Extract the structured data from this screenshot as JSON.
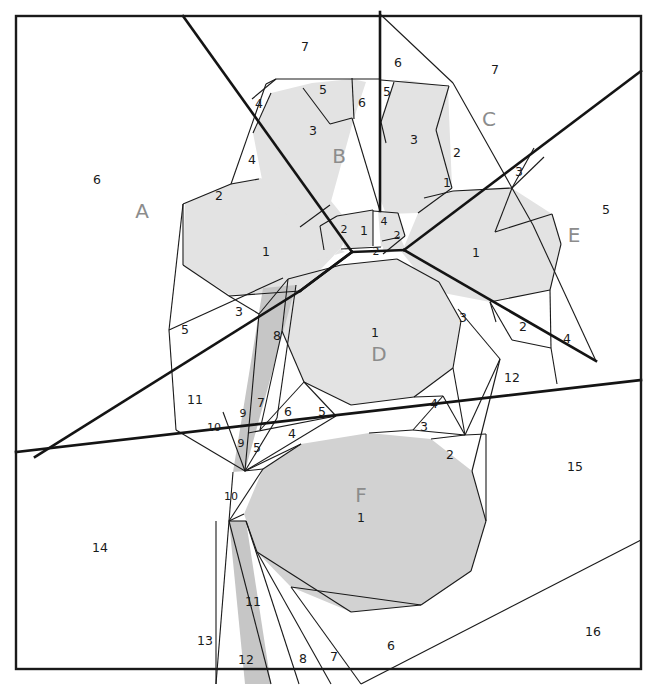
{
  "figure": {
    "width": 657,
    "height": 685,
    "background": "#ffffff",
    "border_color": "#1a1a1a",
    "thin_line_color": "#1a1a1a",
    "thick_line_color": "#141414"
  },
  "palette": {
    "fill_none": "#ffffff",
    "fill_light": "#e3e3e3",
    "fill_mid": "#d2d2d2",
    "fill_dark": "#c6c6c6",
    "label_cell": "#8c8c8c",
    "label_number": "#1a1a1a"
  },
  "cell_labels": [
    {
      "text": "A",
      "x": 142,
      "y": 212
    },
    {
      "text": "B",
      "x": 339,
      "y": 157
    },
    {
      "text": "C",
      "x": 489,
      "y": 120
    },
    {
      "text": "D",
      "x": 379,
      "y": 355
    },
    {
      "text": "E",
      "x": 574,
      "y": 236
    },
    {
      "text": "F",
      "x": 361,
      "y": 496
    }
  ],
  "region_numbers": [
    {
      "text": "6",
      "x": 97,
      "y": 180
    },
    {
      "text": "7",
      "x": 305,
      "y": 47
    },
    {
      "text": "7",
      "x": 495,
      "y": 70
    },
    {
      "text": "4",
      "x": 259,
      "y": 104
    },
    {
      "text": "5",
      "x": 323,
      "y": 90
    },
    {
      "text": "6",
      "x": 362,
      "y": 103
    },
    {
      "text": "6",
      "x": 398,
      "y": 63
    },
    {
      "text": "5",
      "x": 387,
      "y": 92
    },
    {
      "text": "3",
      "x": 313,
      "y": 131
    },
    {
      "text": "3",
      "x": 414,
      "y": 140
    },
    {
      "text": "4",
      "x": 252,
      "y": 160
    },
    {
      "text": "2",
      "x": 457,
      "y": 153
    },
    {
      "text": "3",
      "x": 519,
      "y": 172
    },
    {
      "text": "1",
      "x": 447,
      "y": 183
    },
    {
      "text": "2",
      "x": 219,
      "y": 196
    },
    {
      "text": "5",
      "x": 606,
      "y": 210
    },
    {
      "text": "1",
      "x": 266,
      "y": 252
    },
    {
      "text": "1",
      "x": 476,
      "y": 253
    },
    {
      "text": "2",
      "x": 344,
      "y": 230,
      "size": "sm"
    },
    {
      "text": "1",
      "x": 364,
      "y": 231
    },
    {
      "text": "4",
      "x": 384,
      "y": 222,
      "size": "sm"
    },
    {
      "text": "2",
      "x": 397,
      "y": 236,
      "size": "sm"
    },
    {
      "text": "2",
      "x": 376,
      "y": 252,
      "size": "sm"
    },
    {
      "text": "3",
      "x": 239,
      "y": 312
    },
    {
      "text": "5",
      "x": 185,
      "y": 330
    },
    {
      "text": "8",
      "x": 277,
      "y": 336
    },
    {
      "text": "1",
      "x": 375,
      "y": 333
    },
    {
      "text": "3",
      "x": 463,
      "y": 318
    },
    {
      "text": "2",
      "x": 523,
      "y": 327
    },
    {
      "text": "4",
      "x": 567,
      "y": 339
    },
    {
      "text": "12",
      "x": 512,
      "y": 378
    },
    {
      "text": "11",
      "x": 195,
      "y": 400
    },
    {
      "text": "7",
      "x": 261,
      "y": 403
    },
    {
      "text": "9",
      "x": 243,
      "y": 414,
      "size": "sm"
    },
    {
      "text": "6",
      "x": 288,
      "y": 412
    },
    {
      "text": "5",
      "x": 322,
      "y": 412
    },
    {
      "text": "4",
      "x": 434,
      "y": 404
    },
    {
      "text": "10",
      "x": 214,
      "y": 428,
      "size": "sm"
    },
    {
      "text": "3",
      "x": 424,
      "y": 427
    },
    {
      "text": "9",
      "x": 241,
      "y": 444,
      "size": "sm"
    },
    {
      "text": "4",
      "x": 292,
      "y": 434
    },
    {
      "text": "5",
      "x": 257,
      "y": 448
    },
    {
      "text": "2",
      "x": 450,
      "y": 455
    },
    {
      "text": "15",
      "x": 575,
      "y": 467
    },
    {
      "text": "10",
      "x": 231,
      "y": 497,
      "size": "sm"
    },
    {
      "text": "1",
      "x": 361,
      "y": 518
    },
    {
      "text": "14",
      "x": 100,
      "y": 548
    },
    {
      "text": "11",
      "x": 253,
      "y": 602
    },
    {
      "text": "13",
      "x": 205,
      "y": 641
    },
    {
      "text": "12",
      "x": 246,
      "y": 660
    },
    {
      "text": "8",
      "x": 303,
      "y": 659
    },
    {
      "text": "7",
      "x": 334,
      "y": 657
    },
    {
      "text": "6",
      "x": 391,
      "y": 646
    },
    {
      "text": "16",
      "x": 593,
      "y": 632
    }
  ],
  "shapes": {
    "light_polygons": [
      "183,204 229,184 258,179 325,196 352,226 341,247 300,290 231,295 184,266",
      "269,92 310,82 352,78 364,82 352,116 329,204 299,226 264,194 252,132",
      "377,80 403,80 447,86 448,112 452,186 417,212 384,214 379,200 378,120",
      "400,217 423,198 452,190 509,186 551,213 560,243 549,289 489,301 432,290 404,246",
      "336,215 372,209 372,245 344,249",
      "377,210 397,212 404,235 380,246",
      "381,240 399,236 404,247 383,253",
      "287,278 340,264 396,258 438,281 460,320 452,367 413,396 350,404 303,381 281,330"
    ],
    "mid_polygons": [
      "243,513 262,468 300,443 368,432 430,438 471,470 485,520 470,570 420,604 350,611 290,586 256,551"
    ],
    "dark_polygons": [
      "262,287 295,284 244,470 232,471",
      "228,520 245,520 270,683 244,683"
    ]
  },
  "thin_lines": [
    "183,16 183,204",
    "16,16 641,16",
    "16,16 16,669",
    "641,16 641,669",
    "16,669 641,669"
  ]
}
